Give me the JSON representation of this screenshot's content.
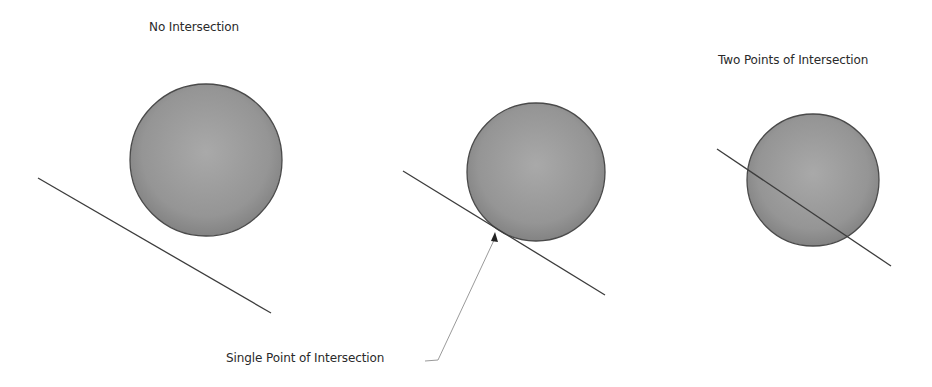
{
  "diagram": {
    "panels": [
      {
        "id": "no-intersection",
        "label": "No Intersection",
        "label_pos": [
          149,
          20
        ],
        "circle": {
          "cx": 206,
          "cy": 160,
          "r": 76
        },
        "line": {
          "x1": 38,
          "y1": 178,
          "x2": 271,
          "y2": 313
        }
      },
      {
        "id": "single-point",
        "label": "Single Point of Intersection",
        "label_pos": [
          226,
          351
        ],
        "circle": {
          "cx": 536,
          "cy": 172,
          "r": 69
        },
        "line": {
          "x1": 403,
          "y1": 171,
          "x2": 605,
          "y2": 295
        },
        "pointer": {
          "tip": [
            495,
            232
          ],
          "elbow": [
            438,
            360
          ],
          "end": [
            425,
            361
          ]
        }
      },
      {
        "id": "two-points",
        "label": "Two Points of Intersection",
        "label_pos": [
          718,
          53
        ],
        "circle": {
          "cx": 813,
          "cy": 180,
          "r": 66
        },
        "line": {
          "x1": 717,
          "y1": 149,
          "x2": 891,
          "y2": 266
        }
      }
    ],
    "colors": {
      "circle_fill_center": "#a8a8a8",
      "circle_fill_edge": "#7e7e7e",
      "circle_stroke": "#4a4a4a",
      "line": "#3c3c3c",
      "pointer": "#9a9a9a",
      "text": "#2a2a2a"
    }
  }
}
